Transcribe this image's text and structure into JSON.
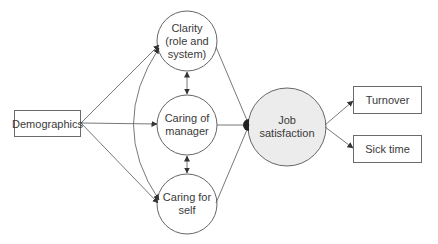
{
  "diagram": {
    "type": "path-model",
    "nodes": {
      "demographics": {
        "label": "Demographics",
        "shape": "rectangle"
      },
      "clarity": {
        "label": "Clarity (role and system)",
        "line1": "Clarity",
        "line2": "(role and",
        "line3": "system)",
        "shape": "circle"
      },
      "caring_manager": {
        "label": "Caring of manager",
        "line1": "Caring of",
        "line2": "manager",
        "shape": "circle"
      },
      "caring_self": {
        "label": "Caring for self",
        "line1": "Caring for",
        "line2": "self",
        "shape": "circle"
      },
      "job_satisfaction": {
        "label": "Job satisfaction",
        "line1": "Job",
        "line2": "satisfaction",
        "shape": "circle",
        "fill": "#ececec"
      },
      "turnover": {
        "label": "Turnover",
        "shape": "rectangle"
      },
      "sick_time": {
        "label": "Sick time",
        "shape": "rectangle"
      }
    },
    "edges": [
      {
        "from": "demographics",
        "to": "clarity",
        "type": "directed"
      },
      {
        "from": "demographics",
        "to": "caring_manager",
        "type": "directed"
      },
      {
        "from": "demographics",
        "to": "caring_self",
        "type": "directed"
      },
      {
        "from": "clarity",
        "to": "caring_manager",
        "type": "bidirectional"
      },
      {
        "from": "caring_manager",
        "to": "caring_self",
        "type": "bidirectional"
      },
      {
        "from": "clarity",
        "to": "caring_self",
        "type": "bidirectional-curved"
      },
      {
        "from": "clarity",
        "to": "job_satisfaction",
        "type": "directed"
      },
      {
        "from": "caring_manager",
        "to": "job_satisfaction",
        "type": "directed"
      },
      {
        "from": "caring_self",
        "to": "job_satisfaction",
        "type": "directed"
      },
      {
        "from": "job_satisfaction",
        "to": "turnover",
        "type": "directed"
      },
      {
        "from": "job_satisfaction",
        "to": "sick_time",
        "type": "directed"
      }
    ],
    "colors": {
      "line": "#555555",
      "circle_fill": "#ffffff",
      "outcome_fill": "#ececec"
    }
  }
}
